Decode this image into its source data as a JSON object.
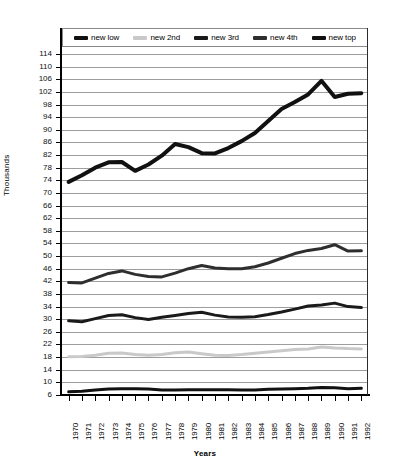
{
  "chart_data": {
    "type": "line",
    "title": "",
    "xlabel": "Years",
    "ylabel": "Thousands",
    "grid": true,
    "legend_position": "top",
    "ylim": [
      6,
      114
    ],
    "ystep": 4,
    "ytick_labels": [
      "114",
      "110",
      "106",
      "102",
      "98",
      "94",
      "90",
      "86",
      "82",
      "78",
      "74",
      "70",
      "66",
      "62",
      "58",
      "54",
      "50",
      "46",
      "42",
      "38",
      "34",
      "30",
      "26",
      "22",
      "18",
      "14",
      "10",
      "6"
    ],
    "categories": [
      "1970",
      "1971",
      "1972",
      "1973",
      "1974",
      "1975",
      "1976",
      "1977",
      "1978",
      "1979",
      "1980",
      "1981",
      "1982",
      "1983",
      "1984",
      "1985",
      "1986",
      "1987",
      "1988",
      "1989",
      "1990",
      "1991",
      "1992"
    ],
    "series": [
      {
        "name": "new low",
        "color": "#111111",
        "width": 3,
        "values": [
          7.0,
          7.2,
          7.6,
          7.9,
          8.0,
          8.0,
          7.9,
          7.6,
          7.6,
          7.7,
          7.7,
          7.7,
          7.7,
          7.6,
          7.6,
          7.8,
          7.9,
          8.0,
          8.1,
          8.4,
          8.3,
          8.0,
          8.1
        ]
      },
      {
        "name": "new 2nd",
        "color": "#c9c9c9",
        "width": 3,
        "values": [
          18.1,
          18.2,
          18.6,
          19.2,
          19.3,
          18.8,
          18.6,
          18.8,
          19.4,
          19.6,
          19.1,
          18.6,
          18.5,
          18.8,
          19.2,
          19.6,
          20.0,
          20.4,
          20.6,
          21.2,
          20.9,
          20.7,
          20.6
        ]
      },
      {
        "name": "new 3rd",
        "color": "#1a1a1a",
        "width": 3,
        "values": [
          29.5,
          29.2,
          30.2,
          31.2,
          31.4,
          30.5,
          29.9,
          30.6,
          31.2,
          31.8,
          32.2,
          31.3,
          30.7,
          30.6,
          30.8,
          31.5,
          32.3,
          33.2,
          34.2,
          34.5,
          35.1,
          34.0,
          33.7
        ]
      },
      {
        "name": "new 4th",
        "color": "#2e2e2e",
        "width": 3,
        "values": [
          41.6,
          41.5,
          43.0,
          44.5,
          45.3,
          44.2,
          43.5,
          43.4,
          44.6,
          46.0,
          47.0,
          46.2,
          46.0,
          46.0,
          46.6,
          47.8,
          49.3,
          50.8,
          51.8,
          52.4,
          53.6,
          51.6,
          51.7
        ]
      },
      {
        "name": "new top",
        "color": "#111111",
        "width": 4,
        "values": [
          73.5,
          75.6,
          78.0,
          79.7,
          79.8,
          77.0,
          79.0,
          81.8,
          85.5,
          84.5,
          82.6,
          82.5,
          84.2,
          86.4,
          89.0,
          92.8,
          96.6,
          98.8,
          101.2,
          105.5,
          100.4,
          101.4,
          101.6
        ]
      }
    ]
  },
  "legend": {
    "items": [
      {
        "label": "new low",
        "color": "#111111"
      },
      {
        "label": "new 2nd",
        "color": "#c9c9c9"
      },
      {
        "label": "new 3rd",
        "color": "#1a1a1a"
      },
      {
        "label": "new 4th",
        "color": "#2e2e2e"
      },
      {
        "label": "new top",
        "color": "#111111"
      }
    ]
  },
  "axes": {
    "x_title": "Years",
    "y_title": "Thousands"
  }
}
